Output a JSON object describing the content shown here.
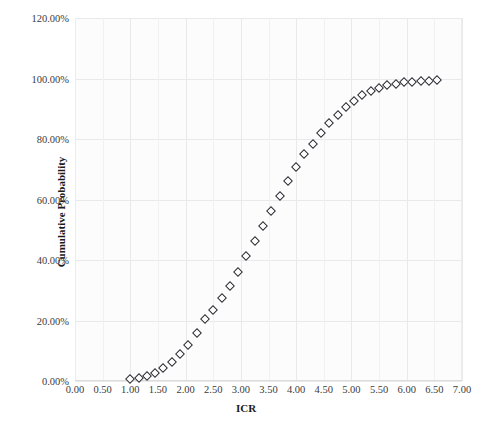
{
  "chart_data": {
    "type": "scatter",
    "title": "",
    "xlabel": "ICR",
    "ylabel": "Cumulative Probability",
    "xlim": [
      0.0,
      7.0
    ],
    "ylim": [
      0.0,
      1.2
    ],
    "xticks": [
      "0.00",
      "0.50",
      "1.00",
      "1.50",
      "2.00",
      "2.50",
      "3.00",
      "3.50",
      "4.00",
      "4.50",
      "5.00",
      "5.50",
      "6.00",
      "6.50",
      "7.00"
    ],
    "xtick_values": [
      0.0,
      0.5,
      1.0,
      1.5,
      2.0,
      2.5,
      3.0,
      3.5,
      4.0,
      4.5,
      5.0,
      5.5,
      6.0,
      6.5,
      7.0
    ],
    "yticks": [
      "0.00%",
      "20.00%",
      "40.00%",
      "60.00%",
      "80.00%",
      "100.00%",
      "120.00%"
    ],
    "ytick_values": [
      0.0,
      0.2,
      0.4,
      0.6,
      0.8,
      1.0,
      1.2
    ],
    "grid": true,
    "legend": null,
    "marker": "open-diamond",
    "marker_color": "#2b2b33",
    "x": [
      1.0,
      1.15,
      1.3,
      1.45,
      1.6,
      1.75,
      1.9,
      2.05,
      2.2,
      2.35,
      2.5,
      2.65,
      2.8,
      2.95,
      3.1,
      3.25,
      3.4,
      3.55,
      3.7,
      3.85,
      4.0,
      4.15,
      4.3,
      4.45,
      4.6,
      4.75,
      4.9,
      5.05,
      5.2,
      5.35,
      5.5,
      5.65,
      5.8,
      5.95,
      6.1,
      6.25,
      6.4,
      6.55
    ],
    "y": [
      0.005,
      0.01,
      0.018,
      0.028,
      0.042,
      0.062,
      0.088,
      0.12,
      0.16,
      0.205,
      0.235,
      0.275,
      0.315,
      0.36,
      0.412,
      0.462,
      0.512,
      0.562,
      0.61,
      0.66,
      0.708,
      0.75,
      0.785,
      0.82,
      0.852,
      0.88,
      0.905,
      0.925,
      0.945,
      0.96,
      0.97,
      0.978,
      0.983,
      0.987,
      0.99,
      0.992,
      0.993,
      0.994
    ],
    "y_percent_labels": [
      "0.50%",
      "1.00%",
      "1.80%",
      "2.80%",
      "4.20%",
      "6.20%",
      "8.80%",
      "12.00%",
      "16.00%",
      "20.50%",
      "23.50%",
      "27.50%",
      "31.50%",
      "36.00%",
      "41.20%",
      "46.20%",
      "51.20%",
      "56.20%",
      "61.00%",
      "66.00%",
      "70.80%",
      "75.00%",
      "78.50%",
      "82.00%",
      "85.20%",
      "88.00%",
      "90.50%",
      "92.50%",
      "94.50%",
      "96.00%",
      "97.00%",
      "97.80%",
      "98.30%",
      "98.70%",
      "99.00%",
      "99.20%",
      "99.30%",
      "99.40%"
    ]
  },
  "axis": {
    "x_title": "ICR",
    "y_title": "Cumulative Probability"
  },
  "colors": {
    "marker_outline": "#2b2b33",
    "grid": "#e9e9ea",
    "background": "#ffffff",
    "plot_background": "#fcfcfc",
    "text": "#3b3b3d"
  }
}
